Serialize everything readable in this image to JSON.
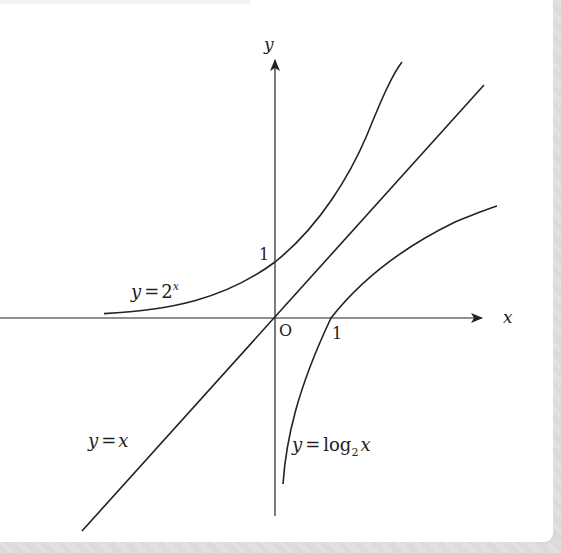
{
  "diagram": {
    "title": "",
    "axes": {
      "x_label": "x",
      "y_label": "y",
      "origin_label": "O",
      "x_tick_label": "1",
      "y_tick_label": "1"
    },
    "curves": [
      {
        "name": "exponential",
        "label_lhs": "y",
        "label_eq": "=",
        "label_base": "2",
        "label_exp": "x",
        "function": "y = 2^x"
      },
      {
        "name": "identity",
        "label_lhs": "y",
        "label_eq": "=",
        "label_rhs": "x",
        "function": "y = x"
      },
      {
        "name": "logarithm",
        "label_lhs": "y",
        "label_eq": "=",
        "label_log": "log",
        "label_sub": "2",
        "label_arg": "x",
        "function": "y = log_2 x"
      }
    ],
    "colors": {
      "stroke": "#222222",
      "frame": "#d9d9d9"
    }
  }
}
